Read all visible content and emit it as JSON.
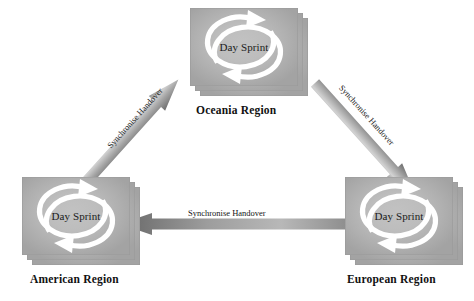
{
  "diagram": {
    "background_color": "#ffffff",
    "node_fill_light": "#c2c2c2",
    "node_fill_dark": "#a3a3a3",
    "arrow_color_light": "#b9b9b9",
    "arrow_color_dark": "#6f6f6f",
    "cycle_icon_color": "#ffffff",
    "label_color": "#111111"
  },
  "nodes": [
    {
      "id": "oceania",
      "region_label": "Oceania Region",
      "inner_label": "Day Sprint",
      "icon": "cycle-arrows-icon",
      "stack_count": 3
    },
    {
      "id": "american",
      "region_label": "American Region",
      "inner_label": "Day Sprint",
      "icon": "cycle-arrows-icon",
      "stack_count": 3
    },
    {
      "id": "european",
      "region_label": "European Region",
      "inner_label": "Day Sprint",
      "icon": "cycle-arrows-icon",
      "stack_count": 3
    }
  ],
  "edges": [
    {
      "id": "american-to-oceania",
      "label": "Synchronise Handover",
      "from": "American Region",
      "to": "Oceania Region",
      "direction": "up-right"
    },
    {
      "id": "oceania-to-european",
      "label": "Synchronise Handover",
      "from": "Oceania Region",
      "to": "European Region",
      "direction": "down-right"
    },
    {
      "id": "european-to-american",
      "label": "Synchronise Handover",
      "from": "European Region",
      "to": "American Region",
      "direction": "left"
    }
  ]
}
